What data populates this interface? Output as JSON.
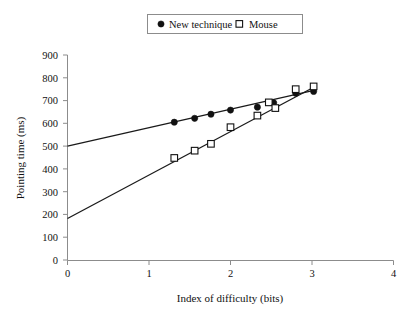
{
  "chart_data": {
    "type": "scatter",
    "title": "",
    "xlabel": "Index of difficulty (bits)",
    "ylabel": "Pointing time (ms)",
    "xlim": [
      0,
      4
    ],
    "ylim": [
      0,
      900
    ],
    "xticks": [
      "0",
      "1",
      "2",
      "3",
      "4"
    ],
    "yticks": [
      "0",
      "100",
      "200",
      "300",
      "400",
      "500",
      "600",
      "700",
      "800",
      "900"
    ],
    "grid": false,
    "legend_position": "top-center",
    "series": [
      {
        "name": "New technique",
        "marker": "filled-circle",
        "points": [
          {
            "x": 1.31,
            "y": 605
          },
          {
            "x": 1.56,
            "y": 622
          },
          {
            "x": 1.76,
            "y": 640
          },
          {
            "x": 2.0,
            "y": 658
          },
          {
            "x": 2.33,
            "y": 671
          },
          {
            "x": 2.53,
            "y": 690
          },
          {
            "x": 2.8,
            "y": 732
          },
          {
            "x": 3.02,
            "y": 740
          }
        ],
        "fit_line": {
          "x0": 0,
          "y0": 500,
          "x1": 3.05,
          "y1": 747
        }
      },
      {
        "name": "Mouse",
        "marker": "open-square",
        "points": [
          {
            "x": 1.31,
            "y": 448
          },
          {
            "x": 1.56,
            "y": 480
          },
          {
            "x": 1.76,
            "y": 510
          },
          {
            "x": 2.0,
            "y": 583
          },
          {
            "x": 2.33,
            "y": 634
          },
          {
            "x": 2.47,
            "y": 692
          },
          {
            "x": 2.55,
            "y": 667
          },
          {
            "x": 2.8,
            "y": 750
          },
          {
            "x": 3.02,
            "y": 762
          }
        ],
        "fit_line": {
          "x0": 0,
          "y0": 182,
          "x1": 3.05,
          "y1": 764
        }
      }
    ]
  },
  "legend": {
    "entries": [
      {
        "label": "New technique",
        "marker": "filled-circle"
      },
      {
        "label": "Mouse",
        "marker": "open-square"
      }
    ]
  },
  "axes": {
    "x_title": "Index of difficulty (bits)",
    "y_title": "Pointing time (ms)",
    "x_tick_labels": [
      "0",
      "1",
      "2",
      "3",
      "4"
    ],
    "y_tick_labels": [
      "900",
      "800",
      "700",
      "600",
      "500",
      "400",
      "300",
      "200",
      "100",
      "0"
    ]
  },
  "colors": {
    "axis": "#8c8c8c",
    "line": "#1a1a1a",
    "marker_fill": "#111111",
    "background": "#ffffff"
  }
}
